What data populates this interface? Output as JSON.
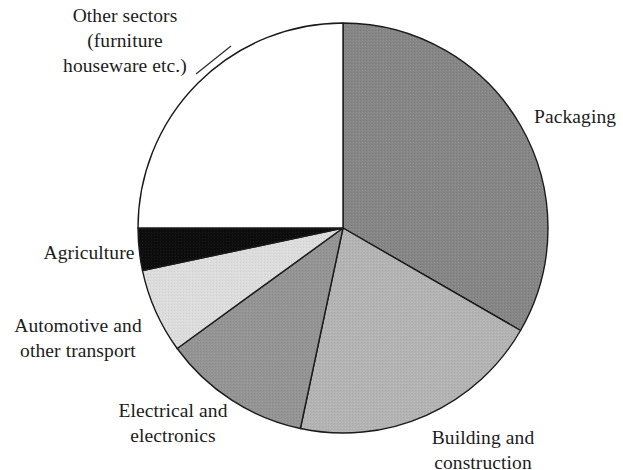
{
  "chart_data": {
    "type": "pie",
    "title": "",
    "subtitle": "",
    "xlabel": "",
    "ylabel": "",
    "legend_position": "none",
    "grid": false,
    "start_angle_deg": 0,
    "direction": "clockwise",
    "categories": [
      "Packaging",
      "Building and construction",
      "Electrical and electronics",
      "Automotive and other transport",
      "Agriculture",
      "Other sectors (furniture houseware etc.)"
    ],
    "values": [
      33.3,
      20.0,
      11.7,
      6.7,
      3.3,
      25.0
    ],
    "units": "percent",
    "slices": [
      {
        "label": "Packaging",
        "value": 33.3,
        "start_deg": 0,
        "end_deg": 120,
        "fill": "#868686",
        "fill_name": "dark-grey",
        "stroke": "#1a1a1a"
      },
      {
        "label": "Building and construction",
        "value": 20.0,
        "start_deg": 120,
        "end_deg": 192,
        "fill": "#b3b3b3",
        "fill_name": "light-mid-grey",
        "stroke": "#1a1a1a"
      },
      {
        "label": "Electrical and electronics",
        "value": 11.7,
        "start_deg": 192,
        "end_deg": 234,
        "fill": "#949494",
        "fill_name": "mid-grey",
        "stroke": "#1a1a1a"
      },
      {
        "label": "Automotive and other transport",
        "value": 6.7,
        "start_deg": 234,
        "end_deg": 258,
        "fill": "#dcdcdc",
        "fill_name": "very-light-grey",
        "stroke": "#1a1a1a"
      },
      {
        "label": "Agriculture",
        "value": 3.3,
        "start_deg": 258,
        "end_deg": 270,
        "fill": "#0d0d0d",
        "fill_name": "black",
        "stroke": "#1a1a1a"
      },
      {
        "label": "Other sectors (furniture houseware etc.)",
        "value": 25.0,
        "start_deg": 270,
        "end_deg": 360,
        "fill": "#ffffff",
        "fill_name": "white",
        "stroke": "#1a1a1a"
      }
    ]
  },
  "labels": {
    "other_sectors": {
      "line1": "Other sectors",
      "line2": "(furniture",
      "line3": "houseware etc.)"
    },
    "packaging": {
      "line1": "Packaging"
    },
    "building": {
      "line1": "Building and",
      "line2": "construction"
    },
    "electrical": {
      "line1": "Electrical and",
      "line2": "electronics"
    },
    "automotive": {
      "line1": "Automotive and",
      "line2": "other transport"
    },
    "agriculture": {
      "line1": "Agriculture"
    }
  },
  "geometry": {
    "center_x": 343,
    "center_y": 228,
    "radius": 205
  },
  "colors": {
    "background": "#ffffff",
    "outline": "#1a1a1a",
    "text": "#1c1c1c"
  }
}
